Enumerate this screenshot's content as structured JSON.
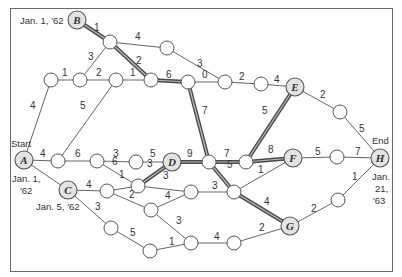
{
  "diagram": {
    "type": "pert_network",
    "events": {
      "A": {
        "label": "A",
        "annotation_top": "Start",
        "annotation_lines": [
          "Jan. 1,",
          "'62"
        ]
      },
      "B": {
        "label": "B",
        "annotation_lines": [
          "Jan. 1, '62"
        ]
      },
      "C": {
        "label": "C",
        "annotation_lines": [
          "Jan. 5, '62"
        ]
      },
      "D": {
        "label": "D"
      },
      "E": {
        "label": "E"
      },
      "F": {
        "label": "F"
      },
      "G": {
        "label": "G"
      },
      "H": {
        "label": "H",
        "annotation_top": "End",
        "annotation_lines": [
          "Jan.",
          "21,",
          "'63"
        ]
      }
    },
    "edge_labels": {
      "B_n1": "1",
      "n1_n2": "4",
      "n1_n4": "3",
      "n1_n7": "2",
      "n2_n8": "3",
      "n3_n4": "1",
      "n4_n5": "2",
      "n5_n7": "1",
      "n7_n6": "6",
      "n6_n8": "0",
      "n8_n9": "2",
      "n9_E": "4",
      "A_n3": "4",
      "A_n11": "4",
      "n11_n5": "5",
      "n11_n12": "6",
      "n12_n13": "3",
      "n13_D": "5",
      "D_n14": "9",
      "n6_n14": "7",
      "n14_n15": "7",
      "n15_E": "5",
      "n15_F": "8",
      "E_n10": "2",
      "n10_H": "5",
      "F_n16": "5",
      "n16_H": "7",
      "n12_n17": "6",
      "n17_D": "3",
      "A_C": "2",
      "C_n18": "4",
      "n18_n17": "1",
      "n17_n19": "3",
      "n18_n21": "2",
      "n21_n19": "4",
      "n19_n20": "3",
      "n14_n20": "5",
      "n20_F": "1",
      "n20_G": "4",
      "G_n22": "2",
      "n22_H": "1",
      "C_n23": "3",
      "n23_n25": "5",
      "n21_n24": "3",
      "n25_n24": "1",
      "n24_n26": "4",
      "n26_G": "2"
    },
    "critical_path": [
      "B",
      "n1",
      "n7",
      "n6",
      "n14",
      "n15",
      "F",
      "D",
      "n17",
      "n20",
      "G"
    ]
  }
}
